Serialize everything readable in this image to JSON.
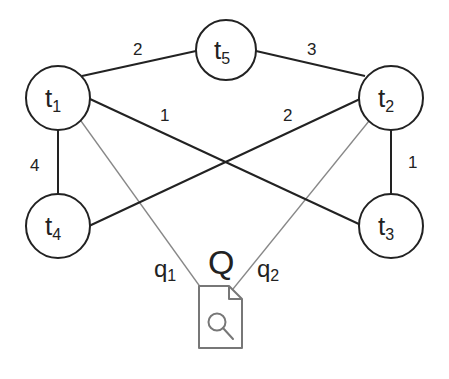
{
  "diagram": {
    "nodes": [
      {
        "id": "t1",
        "base": "t",
        "sub": "1",
        "cx": 58,
        "cy": 98
      },
      {
        "id": "t2",
        "base": "t",
        "sub": "2",
        "cx": 391,
        "cy": 98
      },
      {
        "id": "t3",
        "base": "t",
        "sub": "3",
        "cx": 391,
        "cy": 226
      },
      {
        "id": "t4",
        "base": "t",
        "sub": "4",
        "cx": 58,
        "cy": 226
      },
      {
        "id": "t5",
        "base": "t",
        "sub": "5",
        "cx": 226,
        "cy": 50
      }
    ],
    "edges": [
      {
        "from": "t1",
        "to": "t5",
        "weight": "2"
      },
      {
        "from": "t5",
        "to": "t2",
        "weight": "3"
      },
      {
        "from": "t1",
        "to": "t3",
        "weight": "1"
      },
      {
        "from": "t4",
        "to": "t2",
        "weight": "2"
      },
      {
        "from": "t1",
        "to": "t4",
        "weight": "4"
      },
      {
        "from": "t2",
        "to": "t3",
        "weight": "1"
      }
    ],
    "query": {
      "label": "Q",
      "icon": "document-search-icon",
      "links": [
        {
          "from": "t1",
          "label_base": "q",
          "label_sub": "1"
        },
        {
          "from": "t2",
          "label_base": "q",
          "label_sub": "2"
        }
      ]
    },
    "colors": {
      "edge": "#222222",
      "query_edge": "#888888",
      "icon": "#777777"
    }
  }
}
